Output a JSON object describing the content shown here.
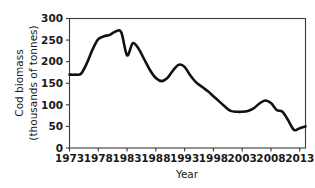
{
  "chart_data": {
    "type": "line",
    "title": "",
    "xlabel": "Year",
    "ylabel": "Cod biomass (thousands of tonnes)",
    "ylabel_line1": "Cod biomass",
    "ylabel_line2": "(thousands of tonnes)",
    "xlim": [
      1973,
      2014
    ],
    "ylim": [
      0,
      300
    ],
    "grid": false,
    "legend": "none",
    "line_color": "#111111",
    "xticks": [
      1973,
      1978,
      1983,
      1988,
      1993,
      1998,
      2003,
      2008,
      2013
    ],
    "xtick_labels": [
      "1973",
      "1978",
      "1983",
      "1988",
      "1993",
      "1998",
      "2003",
      "2008",
      "2013"
    ],
    "yticks": [
      0,
      50,
      100,
      150,
      200,
      250,
      300
    ],
    "ytick_labels": [
      "0",
      "50",
      "100",
      "150",
      "200",
      "250",
      "300"
    ],
    "x": [
      1973,
      1974,
      1975,
      1976,
      1977,
      1978,
      1979,
      1980,
      1981,
      1982,
      1983,
      1984,
      1985,
      1986,
      1987,
      1988,
      1989,
      1990,
      1991,
      1992,
      1993,
      1994,
      1995,
      1996,
      1997,
      1998,
      1999,
      2000,
      2001,
      2002,
      2003,
      2004,
      2005,
      2006,
      2007,
      2008,
      2009,
      2010,
      2011,
      2012,
      2013,
      2014
    ],
    "values": [
      170,
      170,
      172,
      196,
      228,
      252,
      259,
      262,
      270,
      268,
      215,
      243,
      230,
      205,
      180,
      162,
      155,
      162,
      180,
      193,
      188,
      168,
      152,
      142,
      132,
      120,
      108,
      96,
      86,
      84,
      84,
      86,
      92,
      103,
      110,
      104,
      88,
      84,
      64,
      42,
      46,
      50
    ]
  },
  "axis": {
    "x_title": "Year",
    "y_title_line1": "Cod biomass",
    "y_title_line2": "(thousands of tonnes)"
  }
}
